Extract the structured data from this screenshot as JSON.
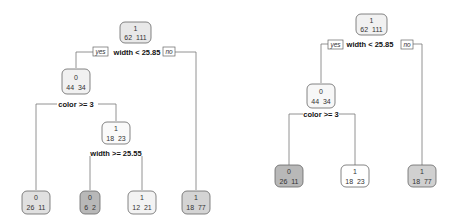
{
  "trees": [
    {
      "name": "full-tree",
      "nodes": [
        {
          "id": "root",
          "class": "1",
          "counts": "62  111",
          "fill": "#e8e8e8"
        },
        {
          "id": "n2",
          "class": "0",
          "counts": "44  34",
          "fill": "#f1f1f1"
        },
        {
          "id": "n3",
          "class": "1",
          "counts": "18  23",
          "fill": "#fafafa"
        },
        {
          "id": "leaf1",
          "class": "0",
          "counts": "26  11",
          "fill": "#e0e0e0"
        },
        {
          "id": "leaf2",
          "class": "0",
          "counts": "6  2",
          "fill": "#b8b8b8"
        },
        {
          "id": "leaf3",
          "class": "1",
          "counts": "12  21",
          "fill": "#f3f3f3"
        },
        {
          "id": "leaf4",
          "class": "1",
          "counts": "18  77",
          "fill": "#d4d4d4"
        }
      ],
      "splits": {
        "root": "width < 25.85",
        "n2": "color >= 3",
        "n3": "width >= 25.55"
      },
      "yes_label": "yes",
      "no_label": "no"
    },
    {
      "name": "pruned-tree",
      "nodes": [
        {
          "id": "root",
          "class": "1",
          "counts": "62  111",
          "fill": "#f1f1f1"
        },
        {
          "id": "n2",
          "class": "0",
          "counts": "44  34",
          "fill": "#f7f7f7"
        },
        {
          "id": "leaf1",
          "class": "0",
          "counts": "26  11",
          "fill": "#b8b8b8"
        },
        {
          "id": "leaf2",
          "class": "1",
          "counts": "18  23",
          "fill": "#ffffff"
        },
        {
          "id": "leaf3",
          "class": "1",
          "counts": "18  77",
          "fill": "#d0d0d0"
        }
      ],
      "splits": {
        "root": "width < 25.85",
        "n2": "color >= 3"
      },
      "yes_label": "yes",
      "no_label": "no"
    }
  ]
}
